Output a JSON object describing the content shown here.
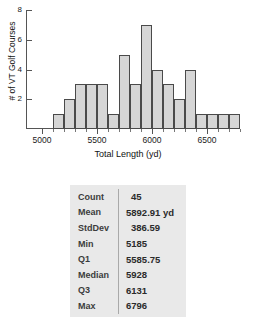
{
  "chart_data": {
    "type": "bar",
    "title": "",
    "xlabel": "Total Length (yd)",
    "ylabel": "# of VT Golf Courses",
    "bin_width": 100,
    "bin_starts": [
      5100,
      5200,
      5300,
      5400,
      5500,
      5600,
      5700,
      5800,
      5900,
      6000,
      6100,
      6200,
      6300,
      6400,
      6500,
      6600,
      6700
    ],
    "categories": [
      "5100-5200",
      "5200-5300",
      "5300-5400",
      "5400-5500",
      "5500-5600",
      "5600-5700",
      "5700-5800",
      "5800-5900",
      "5900-6000",
      "6000-6100",
      "6100-6200",
      "6200-6300",
      "6300-6400",
      "6400-6500",
      "6500-6600",
      "6600-6700",
      "6700-6800"
    ],
    "values": [
      1,
      2,
      3,
      3,
      3,
      1,
      5,
      3,
      7,
      4,
      3,
      2,
      4,
      1,
      1,
      1,
      1
    ],
    "xlim": [
      4950,
      6850
    ],
    "ylim": [
      0,
      8
    ],
    "xticks": [
      5000,
      5500,
      6000,
      6500
    ],
    "xtick_labels": [
      "5000",
      "5500",
      "6000",
      "6500"
    ],
    "yticks": [
      2,
      4,
      6,
      8
    ],
    "ytick_labels": [
      "2",
      "4",
      "6",
      "8"
    ],
    "grid": false,
    "legend": null,
    "bar_fill": "#d6d6d6",
    "bar_stroke": "#4a4a4a"
  },
  "stats_table": {
    "background": "#e9e9e9",
    "rows": [
      {
        "label": "Count",
        "value": "45"
      },
      {
        "label": "Mean",
        "value": "5892.91 yd"
      },
      {
        "label": "StdDev",
        "value": "386.59"
      },
      {
        "label": "Min",
        "value": "5185"
      },
      {
        "label": "Q1",
        "value": "5585.75"
      },
      {
        "label": "Median",
        "value": "5928"
      },
      {
        "label": "Q3",
        "value": "6131"
      },
      {
        "label": "Max",
        "value": "6796"
      }
    ]
  }
}
